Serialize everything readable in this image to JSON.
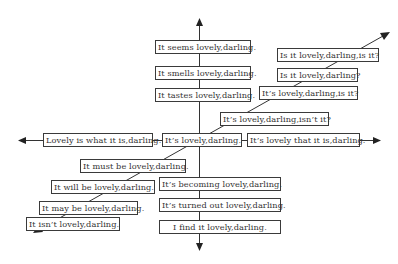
{
  "diagram": {
    "type": "axes-with-labeled-boxes",
    "colors": {
      "line": "#333333",
      "box_border": "#3a3a3a",
      "text": "#333333",
      "background": "#ffffff"
    },
    "vertical_axis": {
      "up": [
        "It seems lovely,darling.",
        "It smells lovely,darling.",
        "It tastes lovely,darling."
      ],
      "down": [
        "It's becoming lovely,darling.",
        "It's turned out lovely,darling.",
        "I find it lovely,darling."
      ]
    },
    "horizontal_axis": {
      "left": "Lovely is what it is,darling.",
      "center": "It's lovely,darling.",
      "right": "It's lovely that it is,darling."
    },
    "diagonal_axis": {
      "upper_right": [
        "It's lovely,darling,isn't it?",
        "It's lovely,darling,is it?",
        "Is it lovely,darling?",
        "Is it lovely,darling,is it?"
      ],
      "lower_left": [
        "It must be lovely,darling.",
        "It will be lovely,darling.",
        "It may be lovely,darling.",
        "It isn't lovely,darling."
      ]
    },
    "boxes": {
      "seems": "It seems lovely,darling.",
      "smells": "It smells lovely,darling.",
      "tastes": "It tastes lovely,darling.",
      "is_it_is_it": "Is it lovely,darling,is it?",
      "is_it": "Is it lovely,darling?",
      "its_is_it": "It’s lovely,darling,is it?",
      "isnt_it": "It’s lovely,darling,isn’t it?",
      "lovely_is_what": "Lovely is what it is,darling.",
      "center": "It’s lovely,darling.",
      "lovely_that": "It’s lovely that it is,darling.",
      "must_be": "It must be lovely,darling.",
      "will_be": "It will be lovely,darling.",
      "becoming": "It’s becoming lovely,darling.",
      "may_be": "It may be lovely,darling.",
      "turned_out": "It’s turned out lovely,darling.",
      "isnt": "It isn’t lovely,darling.",
      "find_it": "I find it lovely,darling."
    }
  }
}
